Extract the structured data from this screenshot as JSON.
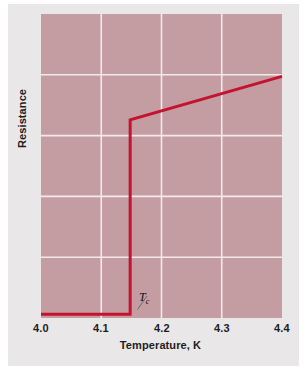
{
  "figure": {
    "background_color": "#e9e7e7",
    "page_color": "#ffffff"
  },
  "chart_data": {
    "type": "line",
    "title": "",
    "subtitle": "",
    "xlabel": "Temperature, K",
    "ylabel": "Resistance",
    "xlim": [
      4.0,
      4.4
    ],
    "ylim": [
      0,
      1
    ],
    "xticks": [
      "4.0",
      "4.1",
      "4.2",
      "4.3",
      "4.4"
    ],
    "xtick_values": [
      4.0,
      4.1,
      4.2,
      4.3,
      4.4
    ],
    "yticks": [],
    "grid": true,
    "grid_color": "#f2eaea",
    "grid_x_values": [
      4.1,
      4.2,
      4.3
    ],
    "grid_y_fractions": [
      0.2,
      0.4,
      0.6,
      0.8
    ],
    "plot_background": "#c29a9f",
    "legend": "none",
    "series": [
      {
        "name": "Resistance of superconductor",
        "color": "#c4122f",
        "linewidth": 3,
        "x": [
          4.0,
          4.148,
          4.148,
          4.4
        ],
        "y": [
          0.012,
          0.012,
          0.652,
          0.795
        ]
      }
    ],
    "annotations": [
      {
        "name": "critical-temperature",
        "text": "Tc",
        "text_main": "T",
        "text_sub": "c",
        "x": 4.155,
        "y": 0.1,
        "pointer_to_x": 4.148,
        "pointer_to_y": 0.012,
        "description": "Critical temperature marker at the resistance step"
      }
    ]
  }
}
